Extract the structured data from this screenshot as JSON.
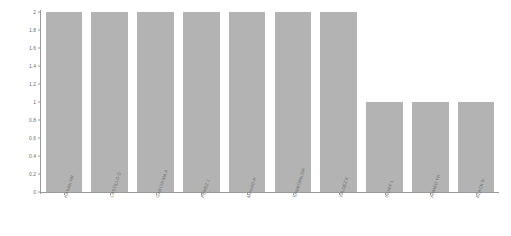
{
  "chart_data": {
    "type": "bar",
    "title": "",
    "subtitle": "",
    "xlabel": "",
    "ylabel": "",
    "categories": [
      "HASAN HR",
      "CASTILLO D",
      "GARCIA MA A",
      "PEREZ J",
      "MAGAD R",
      "SAMBORN DR",
      "VALDEZ E",
      "INDIFF L",
      "AHMED YR",
      "BLACK N"
    ],
    "values": [
      2,
      2,
      2,
      2,
      2,
      2,
      2,
      1,
      1,
      1
    ],
    "ylim": [
      0,
      2
    ],
    "yticks": [
      0,
      0.2,
      0.4,
      0.6,
      0.8,
      1,
      1.2,
      1.4,
      1.6,
      1.8,
      2
    ],
    "ytick_labels": [
      "0",
      "0.2",
      "0.4",
      "0.6",
      "0.8",
      "1",
      "1.2",
      "1.4",
      "1.6",
      "1.8",
      "2"
    ],
    "grid": false,
    "legend": null,
    "legend_position": "none",
    "bar_color": "#b3b3b3",
    "axis_color": "#9a9a9a",
    "tick_label_color": "#6e6e6e",
    "background_color": "#ffffff"
  }
}
